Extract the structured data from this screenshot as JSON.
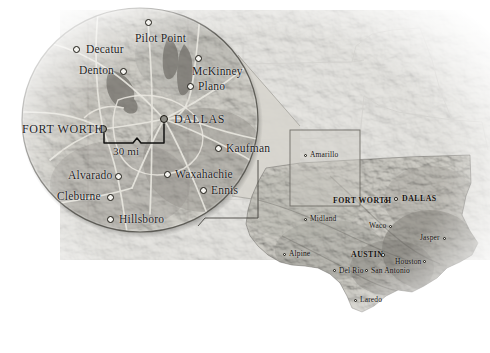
{
  "figure": {
    "type": "locator-map",
    "scale_bar": {
      "label": "30 mi",
      "between": [
        "FORT WORTH",
        "DALLAS"
      ]
    }
  },
  "inset": {
    "name": "dallas-fort-worth-detail-ellipse",
    "cities": [
      {
        "name": "Pilot Point",
        "dot_x": 148,
        "dot_y": 22,
        "label_x": 135,
        "label_y": 33,
        "anchor": "below",
        "major": false
      },
      {
        "name": "Decatur",
        "dot_x": 76,
        "dot_y": 49,
        "label_x": 86,
        "label_y": 44,
        "anchor": "right",
        "major": false
      },
      {
        "name": "McKinney",
        "dot_x": 198,
        "dot_y": 58,
        "label_x": 192,
        "label_y": 66,
        "anchor": "below",
        "major": false
      },
      {
        "name": "Denton",
        "dot_x": 123,
        "dot_y": 71,
        "label_x": 79,
        "label_y": 65,
        "anchor": "left",
        "major": false
      },
      {
        "name": "Plano",
        "dot_x": 190,
        "dot_y": 86,
        "label_x": 198,
        "label_y": 81,
        "anchor": "right",
        "major": false
      },
      {
        "name": "DALLAS",
        "dot_x": 164,
        "dot_y": 119,
        "label_x": 174,
        "label_y": 113,
        "anchor": "right",
        "major": true
      },
      {
        "name": "FORT WORTH",
        "dot_x": 103,
        "dot_y": 129,
        "label_x": 22,
        "label_y": 123,
        "anchor": "left",
        "major": true
      },
      {
        "name": "Kaufman",
        "dot_x": 218,
        "dot_y": 148,
        "label_x": 226,
        "label_y": 143,
        "anchor": "right",
        "major": false
      },
      {
        "name": "Waxahachie",
        "dot_x": 167,
        "dot_y": 174,
        "label_x": 175,
        "label_y": 169,
        "anchor": "right",
        "major": false
      },
      {
        "name": "Alvarado",
        "dot_x": 118,
        "dot_y": 176,
        "label_x": 68,
        "label_y": 170,
        "anchor": "left",
        "major": false
      },
      {
        "name": "Ennis",
        "dot_x": 203,
        "dot_y": 190,
        "label_x": 211,
        "label_y": 185,
        "anchor": "right",
        "major": false
      },
      {
        "name": "Cleburne",
        "dot_x": 110,
        "dot_y": 197,
        "label_x": 57,
        "label_y": 191,
        "anchor": "left",
        "major": false
      },
      {
        "name": "Hillsboro",
        "dot_x": 110,
        "dot_y": 219,
        "label_x": 119,
        "label_y": 214,
        "anchor": "right",
        "major": false
      }
    ]
  },
  "state_map": {
    "name": "texas-overview",
    "cities": [
      {
        "name": "Amarillo",
        "dot_x": 305,
        "dot_y": 155,
        "label_x": 310,
        "label_y": 151,
        "anchor": "right",
        "major": false
      },
      {
        "name": "FORT WORTH",
        "dot_x": 386,
        "dot_y": 201,
        "label_x": 333,
        "label_y": 197,
        "anchor": "left",
        "major": true
      },
      {
        "name": "DALLAS",
        "dot_x": 396,
        "dot_y": 199,
        "label_x": 402,
        "label_y": 195,
        "anchor": "right",
        "major": true
      },
      {
        "name": "Midland",
        "dot_x": 305,
        "dot_y": 219,
        "label_x": 310,
        "label_y": 215,
        "anchor": "right",
        "major": false
      },
      {
        "name": "Waco",
        "dot_x": 390,
        "dot_y": 226,
        "label_x": 369,
        "label_y": 222,
        "anchor": "left",
        "major": false
      },
      {
        "name": "Jasper",
        "dot_x": 444,
        "dot_y": 238,
        "label_x": 420,
        "label_y": 234,
        "anchor": "left",
        "major": false
      },
      {
        "name": "Alpine",
        "dot_x": 284,
        "dot_y": 254,
        "label_x": 289,
        "label_y": 250,
        "anchor": "right",
        "major": false
      },
      {
        "name": "AUSTIN",
        "dot_x": 383,
        "dot_y": 255,
        "label_x": 351,
        "label_y": 251,
        "anchor": "left",
        "major": true
      },
      {
        "name": "Houston",
        "dot_x": 424,
        "dot_y": 261,
        "label_x": 395,
        "label_y": 258,
        "anchor": "left",
        "major": false
      },
      {
        "name": "Del Rio",
        "dot_x": 334,
        "dot_y": 270,
        "label_x": 339,
        "label_y": 267,
        "anchor": "right",
        "major": false
      },
      {
        "name": "San Antonio",
        "dot_x": 366,
        "dot_y": 270,
        "label_x": 371,
        "label_y": 267,
        "anchor": "right",
        "major": false
      },
      {
        "name": "Laredo",
        "dot_x": 355,
        "dot_y": 300,
        "label_x": 360,
        "label_y": 296,
        "anchor": "right",
        "major": false
      }
    ]
  },
  "colors": {
    "paper": "#ffffff",
    "terrain_light": "#c9c7c0",
    "terrain_mid": "#9a9892",
    "terrain_dark": "#6e6c66",
    "inset_fill": "#8f8d86",
    "highlight_box": "#b9b7b0",
    "outline": "#4a4842",
    "label_text": "#1b1b1b",
    "road": "#e6e4dd",
    "water": "#7d7b75"
  }
}
